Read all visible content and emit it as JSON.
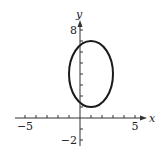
{
  "chart_data": {
    "type": "line",
    "title": "",
    "xlabel": "x",
    "ylabel": "y",
    "xlim": [
      -5,
      5
    ],
    "ylim": [
      -2,
      8
    ],
    "grid": false,
    "x_tick_step": 1,
    "y_tick_step": 1,
    "x_tick_labels": [
      "-5",
      "5"
    ],
    "y_tick_labels": [
      "8",
      "-2"
    ],
    "series": [
      {
        "name": "ellipse",
        "shape": "ellipse",
        "center": [
          1,
          4
        ],
        "semi_axis_x": 2,
        "semi_axis_y": 3,
        "extent_x": [
          -1,
          3
        ],
        "extent_y": [
          1,
          7
        ],
        "color": "#1a1a1a"
      }
    ]
  },
  "labels": {
    "x_axis": "x",
    "y_axis": "y",
    "x_min": "−5",
    "x_max": "5",
    "y_max": "8",
    "y_min": "−2"
  }
}
